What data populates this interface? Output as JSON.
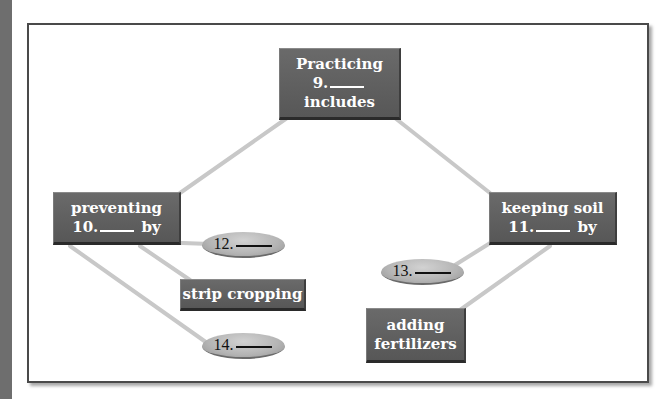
{
  "diagram": {
    "type": "concept-map",
    "root": {
      "lines": [
        "Practicing",
        "9. ____",
        "includes"
      ],
      "number": "9."
    },
    "branches": [
      {
        "id": "left",
        "lines": [
          "preventing",
          "10. ____ by"
        ],
        "number": "10.",
        "children": [
          {
            "type": "blank",
            "label": "12. ____",
            "number": "12."
          },
          {
            "type": "filled",
            "label": "strip cropping"
          },
          {
            "type": "blank",
            "label": "14. ____",
            "number": "14."
          }
        ]
      },
      {
        "id": "right",
        "lines": [
          "keeping soil",
          "11. ____ by"
        ],
        "number": "11.",
        "children": [
          {
            "type": "blank",
            "label": "13. ____",
            "number": "13."
          },
          {
            "type": "filled",
            "label": "adding fertilizers",
            "lines": [
              "adding",
              "fertilizers"
            ]
          }
        ]
      }
    ]
  },
  "colors": {
    "box_fill": "#5c5c5c",
    "box_text": "#ffffff",
    "oval_fill": "#b4b4b4",
    "connector": "#c8c8c8",
    "frame_border": "#4a4a4a",
    "side_strip": "#6e6e6e"
  }
}
